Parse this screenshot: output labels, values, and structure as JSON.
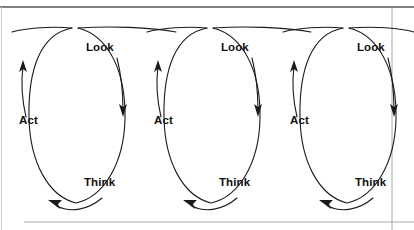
{
  "diagram": {
    "type": "cycle-diagram",
    "repeat_count": 3,
    "cycle_spacing_px": 135.5,
    "background_color": "#ffffff",
    "stroke_color": "#1a1a1a",
    "text_color": "#111111",
    "frame": {
      "top_rule_color": "#555555",
      "bottom_rule_color": "#999999",
      "left_rule_color": "#bbbbbb",
      "right_rule_color": "#999999"
    },
    "stage_labels": {
      "look": "Look",
      "act": "Act",
      "think": "Think"
    },
    "cycles": [
      {
        "index": 1,
        "look": "Look",
        "act": "Act",
        "think": "Think",
        "look_x": 86,
        "look_y": 41,
        "act_x": 19,
        "act_y": 114,
        "think_x": 84,
        "think_y": 176
      },
      {
        "index": 2,
        "look": "Look",
        "act": "Act",
        "think": "Think",
        "look_x": 221,
        "look_y": 41,
        "act_x": 154,
        "act_y": 114,
        "think_x": 219,
        "think_y": 176
      },
      {
        "index": 3,
        "look": "Look",
        "act": "Act",
        "think": "Think",
        "look_x": 357,
        "look_y": 41,
        "act_x": 290,
        "act_y": 114,
        "think_x": 355,
        "think_y": 176
      }
    ],
    "arrows": [
      {
        "name": "look-to-think",
        "direction": "down",
        "cycle": 1
      },
      {
        "name": "think-to-act",
        "direction": "left",
        "cycle": 1
      },
      {
        "name": "act-to-look",
        "direction": "up",
        "cycle": 1
      },
      {
        "name": "look-to-think",
        "direction": "down",
        "cycle": 2
      },
      {
        "name": "think-to-act",
        "direction": "left",
        "cycle": 2
      },
      {
        "name": "act-to-look",
        "direction": "up",
        "cycle": 2
      },
      {
        "name": "look-to-think",
        "direction": "down",
        "cycle": 3
      },
      {
        "name": "think-to-act",
        "direction": "left",
        "cycle": 3
      },
      {
        "name": "act-to-look",
        "direction": "up",
        "cycle": 3
      }
    ]
  }
}
